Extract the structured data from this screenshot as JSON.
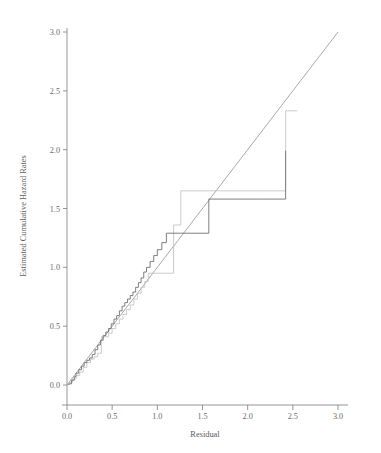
{
  "chart_data": {
    "type": "line",
    "title": "",
    "subtitle": "",
    "xlabel": "Residual",
    "ylabel": "Estimated Cumulative Hazard Rates",
    "xlim": [
      0.0,
      3.0
    ],
    "ylim": [
      0.0,
      3.0
    ],
    "grid": false,
    "legend_position": "none",
    "xticks": [
      "0.0",
      "0.5",
      "1.0",
      "1.5",
      "2.0",
      "2.5",
      "3.0"
    ],
    "xtick_values": [
      0.0,
      0.5,
      1.0,
      1.5,
      2.0,
      2.5,
      3.0
    ],
    "yticks": [
      "0.0",
      "0.5",
      "1.0",
      "1.5",
      "2.0",
      "2.5",
      "3.0"
    ],
    "ytick_values": [
      0.0,
      0.5,
      1.0,
      1.5,
      2.0,
      2.5,
      3.0
    ],
    "colors": {
      "reference_line": "#9a9a9a",
      "series_dark": "#707070",
      "series_light": "#c2c2c2",
      "axis": "#8a8a8a",
      "text": "#5a5a5a",
      "background": "#ffffff"
    },
    "series": [
      {
        "name": "reference-line",
        "style": "straight",
        "x": [
          0.0,
          3.0
        ],
        "values": [
          0.0,
          3.0
        ]
      },
      {
        "name": "estimated-cumulative-hazard-dark",
        "style": "step",
        "x": [
          0.02,
          0.05,
          0.08,
          0.1,
          0.13,
          0.16,
          0.19,
          0.22,
          0.25,
          0.28,
          0.31,
          0.34,
          0.37,
          0.4,
          0.43,
          0.46,
          0.49,
          0.52,
          0.55,
          0.58,
          0.61,
          0.64,
          0.67,
          0.7,
          0.73,
          0.76,
          0.79,
          0.82,
          0.85,
          0.88,
          0.92,
          0.96,
          1.0,
          1.05,
          1.1,
          1.16,
          1.26,
          1.57,
          2.18,
          2.42
        ],
        "values": [
          0.01,
          0.04,
          0.07,
          0.1,
          0.13,
          0.16,
          0.19,
          0.21,
          0.23,
          0.26,
          0.3,
          0.34,
          0.38,
          0.42,
          0.45,
          0.48,
          0.52,
          0.56,
          0.59,
          0.63,
          0.67,
          0.7,
          0.73,
          0.76,
          0.79,
          0.83,
          0.87,
          0.91,
          0.96,
          1.0,
          1.05,
          1.1,
          1.15,
          1.21,
          1.29,
          1.29,
          1.29,
          1.58,
          1.58,
          1.99
        ]
      },
      {
        "name": "estimated-cumulative-hazard-light",
        "style": "step",
        "x": [
          0.02,
          0.06,
          0.1,
          0.14,
          0.18,
          0.22,
          0.26,
          0.3,
          0.34,
          0.38,
          0.42,
          0.46,
          0.5,
          0.54,
          0.58,
          0.62,
          0.66,
          0.7,
          0.74,
          0.78,
          0.82,
          0.86,
          0.9,
          0.95,
          1.0,
          1.06,
          1.12,
          1.18,
          1.26,
          1.58,
          2.26,
          2.42,
          2.55
        ],
        "values": [
          0.02,
          0.05,
          0.08,
          0.11,
          0.15,
          0.19,
          0.22,
          0.24,
          0.27,
          0.41,
          0.41,
          0.44,
          0.48,
          0.52,
          0.56,
          0.6,
          0.64,
          0.68,
          0.73,
          0.78,
          0.83,
          0.88,
          0.95,
          0.95,
          0.95,
          0.95,
          0.95,
          1.36,
          1.65,
          1.65,
          1.65,
          2.33,
          2.33
        ]
      }
    ],
    "annotations": []
  },
  "axes": {
    "y_title": "Estimated Cumulative Hazard Rates",
    "x_title": "Residual",
    "x_tick_labels": [
      "0.0",
      "0.5",
      "1.0",
      "1.5",
      "2.0",
      "2.5",
      "3.0"
    ],
    "y_tick_labels": [
      "0.0",
      "0.5",
      "1.0",
      "1.5",
      "2.0",
      "2.5",
      "3.0"
    ]
  }
}
